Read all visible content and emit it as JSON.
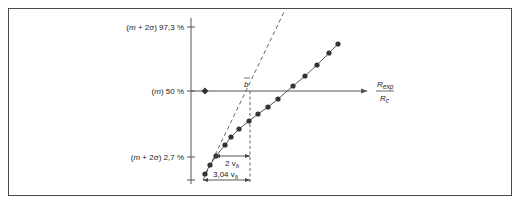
{
  "chart_data": {
    "type": "scatter",
    "title": "",
    "y_axis": {
      "ticks": [
        {
          "label_pre": "(",
          "label_var": "m",
          "label_mid": " + 2σ) ",
          "label_val": "97,3 %",
          "y": 27
        },
        {
          "label_pre": "(",
          "label_var": "m",
          "label_mid": ") ",
          "label_val": "50 %",
          "y": 91
        },
        {
          "label_pre": "(",
          "label_var": "m",
          "label_mid": " + 2σ) ",
          "label_val": "2,7 %",
          "y": 157
        }
      ]
    },
    "x_axis": {
      "label_num": "R",
      "label_num_sub": "exp",
      "label_den": "R",
      "label_den_sub": "c"
    },
    "median_marker": {
      "label": "b",
      "note": "overline"
    },
    "reference_point": {
      "x": 205,
      "y": 91
    },
    "series": [
      {
        "name": "measured points",
        "style": "solid-line-with-dots",
        "points": [
          [
            205,
            174
          ],
          [
            210,
            165
          ],
          [
            216,
            156
          ],
          [
            225,
            145
          ],
          [
            231,
            137
          ],
          [
            239,
            129
          ],
          [
            249,
            121
          ],
          [
            258,
            114
          ],
          [
            268,
            107
          ],
          [
            278,
            99
          ],
          [
            293,
            86
          ],
          [
            305,
            76
          ],
          [
            317,
            65
          ],
          [
            329,
            53
          ],
          [
            338,
            44
          ]
        ]
      },
      {
        "name": "reference slope",
        "style": "dashed",
        "points": [
          [
            203,
            180
          ],
          [
            284,
            12
          ]
        ]
      }
    ],
    "annotations": [
      {
        "text_val": "2 v",
        "text_sub": "δ",
        "from_x": 215,
        "to_x": 250,
        "y": 156
      },
      {
        "text_val": "3,04 v",
        "text_sub": "δ",
        "from_x": 203,
        "to_x": 250,
        "y": 180
      }
    ],
    "vertical_dashed": {
      "x": 250,
      "y_top": 91,
      "y_bottom": 182
    }
  }
}
